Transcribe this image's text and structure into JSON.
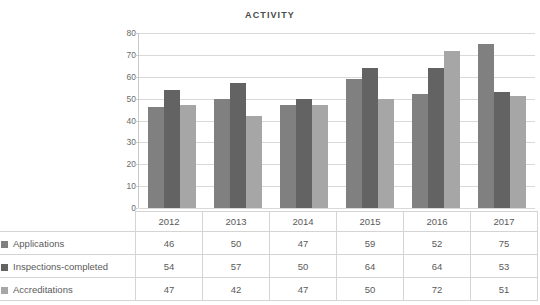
{
  "chart_data": {
    "type": "bar",
    "title": "ACTIVITY",
    "xlabel": "",
    "ylabel": "",
    "categories": [
      "2012",
      "2013",
      "2014",
      "2015",
      "2016",
      "2017"
    ],
    "series": [
      {
        "name": "Applications",
        "values": [
          46,
          50,
          47,
          59,
          52,
          75
        ],
        "color": "#808080"
      },
      {
        "name": "Inspections-completed",
        "values": [
          54,
          57,
          50,
          64,
          64,
          53
        ],
        "color": "#636363"
      },
      {
        "name": "Accreditations",
        "values": [
          47,
          42,
          47,
          50,
          72,
          51
        ],
        "color": "#a6a6a6"
      }
    ],
    "ylim": [
      0,
      80
    ],
    "yticks": [
      0,
      10,
      20,
      30,
      40,
      50,
      60,
      70,
      80
    ],
    "ytick_labels": [
      "0",
      "10",
      "20",
      "30",
      "40",
      "50",
      "60",
      "70",
      "80"
    ],
    "grid": true,
    "legend_position": "table-row-labels"
  },
  "table": {
    "corner_label": "",
    "header": [
      "2012",
      "2013",
      "2014",
      "2015",
      "2016",
      "2017"
    ],
    "rows": [
      {
        "label": "Applications",
        "swatch": "#808080",
        "values": [
          "46",
          "50",
          "47",
          "59",
          "52",
          "75"
        ]
      },
      {
        "label": "Inspections-completed",
        "swatch": "#636363",
        "values": [
          "54",
          "57",
          "50",
          "64",
          "64",
          "53"
        ]
      },
      {
        "label": "Accreditations",
        "swatch": "#a6a6a6",
        "values": [
          "47",
          "42",
          "47",
          "50",
          "72",
          "51"
        ]
      }
    ]
  },
  "colors": {
    "background": "#ffffff",
    "gridline": "#d9d9d9",
    "text": "#5a5a5a",
    "border": "#d4d4d4"
  }
}
